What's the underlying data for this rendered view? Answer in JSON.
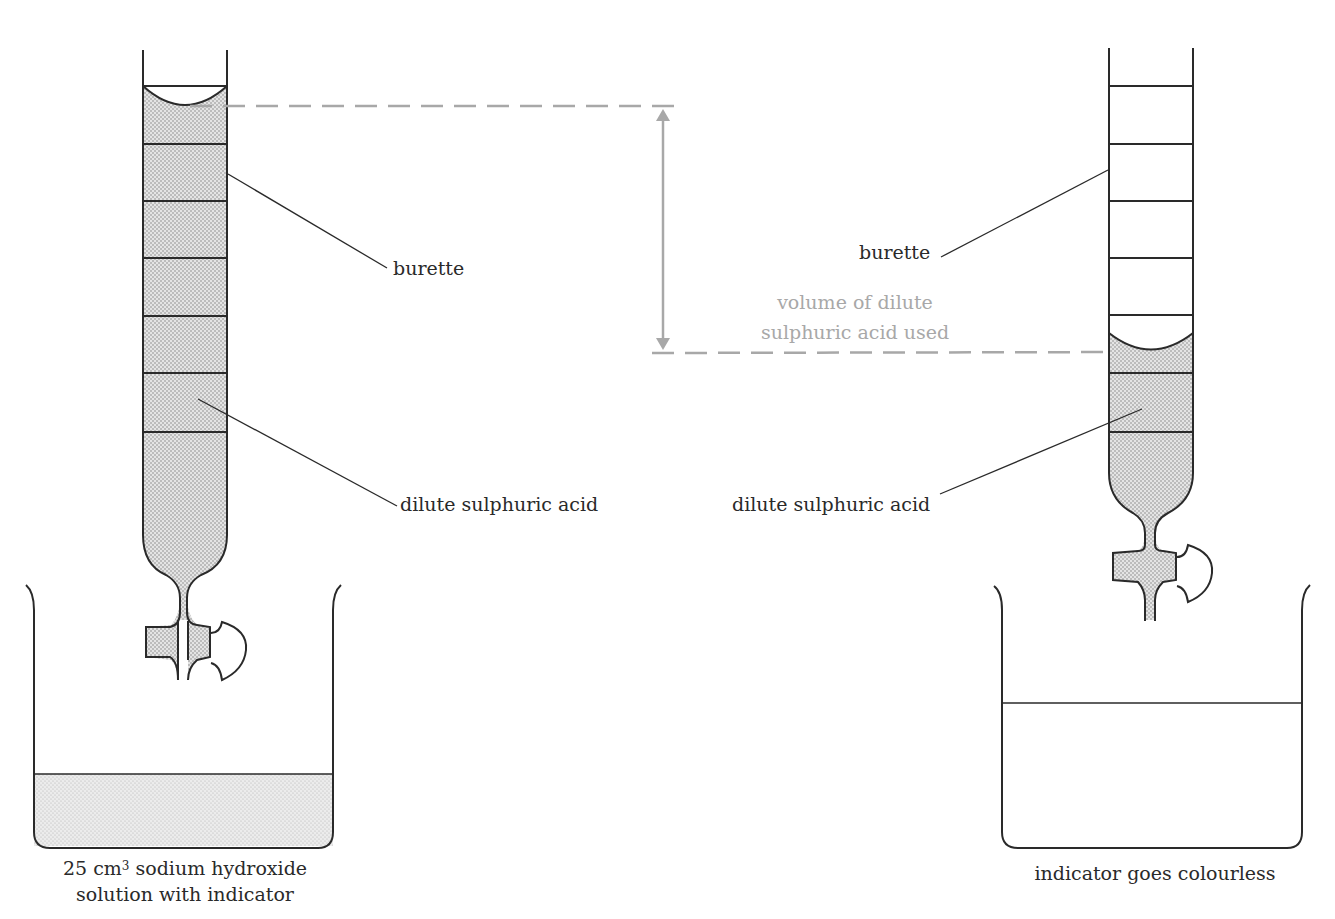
{
  "figure": {
    "left_setup": {
      "burette_label": "burette",
      "acid_label": "dilute sulphuric acid",
      "beaker_caption_line1_prefix": "25 cm",
      "beaker_caption_line1_sup": "3",
      "beaker_caption_line1_suffix": " sodium hydroxide",
      "beaker_caption_line2": "solution with indicator",
      "burette_state": "full",
      "beaker_liquid_state": "shaded"
    },
    "right_setup": {
      "burette_label": "burette",
      "acid_label": "dilute sulphuric acid",
      "beaker_caption": "indicator goes colourless",
      "burette_state": "partially emptied",
      "beaker_liquid_state": "clear"
    },
    "measurement": {
      "label_line1": "volume of dilute",
      "label_line2": "sulphuric acid used"
    },
    "colors": {
      "line": "#2a2a2a",
      "annotation": "#a8a8a8",
      "fill_stipple": "#cfcfcf"
    }
  }
}
